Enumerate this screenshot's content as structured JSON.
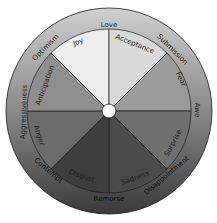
{
  "diagram": {
    "center": {
      "x": 109,
      "y": 111
    },
    "outer_radius": 103,
    "inner_radius": 82,
    "hub_radius": 7,
    "colors": {
      "ring_top": "#cfcfcf",
      "ring_bottom": "#3a3a3a",
      "outline": "#1a1a1a",
      "hub": "#ffffff"
    },
    "primary_emotions": [
      {
        "label": "Joy",
        "fill": "#ededed"
      },
      {
        "label": "Acceptance",
        "fill": "#d9d9d9"
      },
      {
        "label": "Fear",
        "fill": "#9b9b9b"
      },
      {
        "label": "Surprise",
        "fill": "#707070"
      },
      {
        "label": "Sadness",
        "fill": "#4a4a4a"
      },
      {
        "label": "Disgust",
        "fill": "#3e3e3e"
      },
      {
        "label": "Anger",
        "fill": "#6c6c6c"
      },
      {
        "label": "Anticipation",
        "fill": "#8f8f8f"
      }
    ],
    "dyads": [
      {
        "label": "Love"
      },
      {
        "label": "Submission"
      },
      {
        "label": "Awe"
      },
      {
        "label": "Disappointment"
      },
      {
        "label": "Remorse"
      },
      {
        "label": "Contempt"
      },
      {
        "label": "Aggressiveness"
      },
      {
        "label": "Optimism"
      }
    ]
  }
}
